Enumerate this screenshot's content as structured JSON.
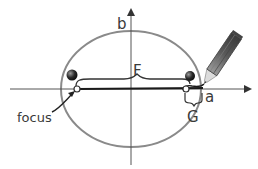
{
  "diagram": {
    "labels": {
      "b": "b",
      "a": "a",
      "F": "F",
      "G": "G",
      "focus": "focus"
    },
    "colors": {
      "background": "#ffffff",
      "ellipse": "#8a8a8a",
      "axis": "#555555",
      "string": "#1a1a1a",
      "pin": "#333333",
      "pencil_body": "#6a6a6a",
      "pencil_wood": "#d9d9d9",
      "text": "#3a3a3a"
    },
    "ellipse": {
      "cx": 131,
      "cy": 89,
      "rx": 70,
      "ry": 58
    },
    "axes": {
      "x": {
        "y": 89,
        "from": 10,
        "to": 252
      },
      "y": {
        "x": 131,
        "from": 8,
        "to": 165
      }
    },
    "foci": [
      {
        "name": "left-focus",
        "x": 77,
        "y": 89
      },
      {
        "name": "right-focus",
        "x": 186,
        "y": 89
      }
    ],
    "pins": [
      {
        "name": "left-pin",
        "x": 72,
        "y": 75
      },
      {
        "name": "right-pin",
        "x": 190,
        "y": 76
      }
    ]
  }
}
